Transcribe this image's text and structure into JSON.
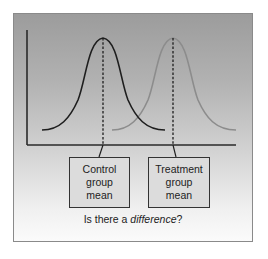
{
  "figure": {
    "labels": {
      "control": [
        "Control",
        "group",
        "mean"
      ],
      "treatment": [
        "Treatment",
        "group",
        "mean"
      ]
    },
    "question": {
      "prefix": "Is there a ",
      "emphasis": "difference",
      "suffix": "?"
    },
    "curves": [
      {
        "name": "control-distribution",
        "color": "#1e1e1e",
        "mean_x": 103
      },
      {
        "name": "treatment-distribution",
        "color": "#8c8c8c",
        "mean_x": 173
      }
    ],
    "colors": {
      "frame_border": "#8a8a8a",
      "axis": "#2a2a2a",
      "control_curve": "#1e1e1e",
      "treatment_curve": "#8c8c8c",
      "box_border": "#333333"
    }
  }
}
